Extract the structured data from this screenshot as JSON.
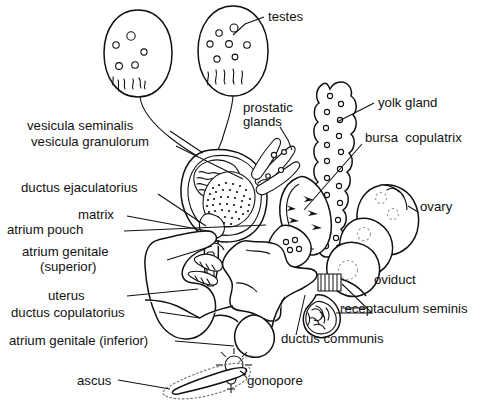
{
  "figure": {
    "background_color": "#ffffff",
    "line_color": "#111111",
    "text_color": "#111111"
  },
  "labels": {
    "testes": "testes",
    "prostatic_glands_line1": "prostatic",
    "prostatic_glands_line2": "glands",
    "yolk_gland": "yolk gland",
    "bursa_copulatrix": "bursa  copulatrix",
    "vesicula_seminalis": "vesicula seminalis",
    "vesicula_granulorum": "vesicula granulorum",
    "ductus_ejaculatorius": "ductus ejaculatorius",
    "matrix": "matrix",
    "atrium_pouch": "atrium pouch",
    "atrium_genitale_superior_line1": "atrium genitale",
    "atrium_genitale_superior_line2": "(superior)",
    "ovary": "ovary",
    "oviduct": "oviduct",
    "receptaculum_seminis": "receptaculum seminis",
    "ductus_communis": "ductus communis",
    "uterus": "uterus",
    "ductus_copulatorius": "ductus copulatorius",
    "atrium_genitale_inferior": "atrium genitale (inferior)",
    "ascus": "ascus",
    "gonopore": "gonopore",
    "sex_symbol": "⚥"
  },
  "parts_list": [
    "testes",
    "prostatic glands",
    "yolk gland",
    "bursa copulatrix",
    "vesicula seminalis",
    "vesicula granulorum",
    "ductus ejaculatorius",
    "matrix",
    "atrium pouch",
    "atrium genitale (superior)",
    "ovary",
    "oviduct",
    "receptaculum seminis",
    "ductus communis",
    "uterus",
    "ductus copulatorius",
    "atrium genitale (inferior)",
    "ascus",
    "gonopore"
  ]
}
